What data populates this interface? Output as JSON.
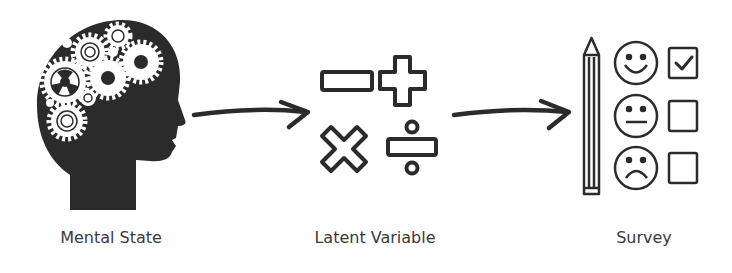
{
  "diagram": {
    "nodes": [
      {
        "id": "mental-state",
        "label": "Mental State",
        "icon": "head-gears-icon"
      },
      {
        "id": "latent-variable",
        "label": "Latent Variable",
        "icon": "math-operators-icon"
      },
      {
        "id": "survey",
        "label": "Survey",
        "icon": "survey-form-icon"
      }
    ],
    "edges": [
      {
        "from": "mental-state",
        "to": "latent-variable"
      },
      {
        "from": "latent-variable",
        "to": "survey"
      }
    ],
    "colors": {
      "ink": "#2b2b2b",
      "background": "#ffffff",
      "label": "#3a3a3a"
    }
  }
}
